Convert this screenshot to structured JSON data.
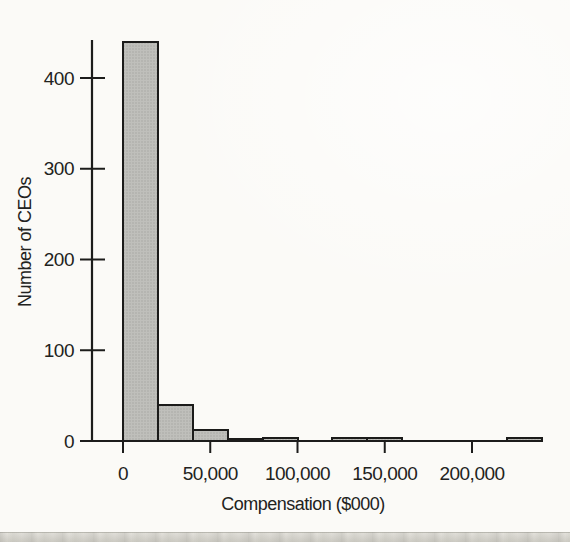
{
  "page": {
    "background_color": "#fbfaf7",
    "bottom_strip_color": "#d8d6cf"
  },
  "chart_data": {
    "type": "bar",
    "subtype": "histogram",
    "title": "",
    "xlabel": "Compensation ($000)",
    "ylabel": "Number of CEOs",
    "bin_width": 20000,
    "bins": [
      {
        "start": 0,
        "end": 20000,
        "count": 440
      },
      {
        "start": 20000,
        "end": 40000,
        "count": 40
      },
      {
        "start": 40000,
        "end": 60000,
        "count": 12
      },
      {
        "start": 60000,
        "end": 80000,
        "count": 2
      },
      {
        "start": 80000,
        "end": 100000,
        "count": 3
      },
      {
        "start": 100000,
        "end": 120000,
        "count": 0
      },
      {
        "start": 120000,
        "end": 140000,
        "count": 3
      },
      {
        "start": 140000,
        "end": 160000,
        "count": 3
      },
      {
        "start": 160000,
        "end": 180000,
        "count": 0
      },
      {
        "start": 180000,
        "end": 200000,
        "count": 0
      },
      {
        "start": 200000,
        "end": 220000,
        "count": 0
      },
      {
        "start": 220000,
        "end": 240000,
        "count": 3
      }
    ],
    "x_ticks": [
      {
        "value": 0,
        "label": "0"
      },
      {
        "value": 50000,
        "label": "50,000"
      },
      {
        "value": 100000,
        "label": "100,000"
      },
      {
        "value": 150000,
        "label": "150,000"
      },
      {
        "value": 200000,
        "label": "200,000"
      }
    ],
    "y_ticks": [
      {
        "value": 0,
        "label": "0"
      },
      {
        "value": 100,
        "label": "100"
      },
      {
        "value": 200,
        "label": "200"
      },
      {
        "value": 300,
        "label": "300"
      },
      {
        "value": 400,
        "label": "400"
      }
    ],
    "xlim": [
      0,
      240000
    ],
    "ylim": [
      0,
      450
    ],
    "grid": false,
    "legend": null,
    "bar_fill": "#bfbfbb",
    "bar_dot_color": "#a4a4a0",
    "bar_stroke": "#1b1b1a",
    "axis_color": "#1c1c1b",
    "text_color": "#222220"
  }
}
